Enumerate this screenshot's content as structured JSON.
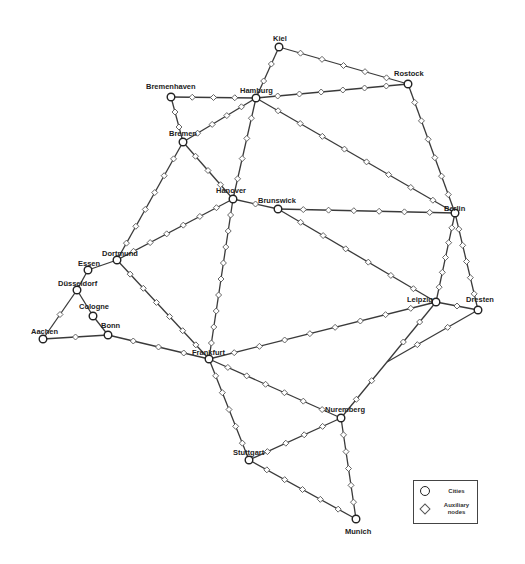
{
  "diagram": {
    "type": "transport-network",
    "edge_color": "#3a3a3a",
    "cities": [
      {
        "id": "kiel",
        "name": "Kiel",
        "x": 279,
        "y": 47,
        "lx": 273,
        "ly": 41
      },
      {
        "id": "rostock",
        "name": "Rostock",
        "x": 408,
        "y": 84,
        "lx": 394,
        "ly": 76
      },
      {
        "id": "bremenhaven",
        "name": "Bremenhaven",
        "x": 171,
        "y": 97,
        "lx": 146,
        "ly": 89
      },
      {
        "id": "hamburg",
        "name": "Hamburg",
        "x": 256,
        "y": 98,
        "lx": 240,
        "ly": 93
      },
      {
        "id": "bremen",
        "name": "Bremen",
        "x": 183,
        "y": 142,
        "lx": 169,
        "ly": 136
      },
      {
        "id": "hanover",
        "name": "Hanover",
        "x": 233,
        "y": 199,
        "lx": 216,
        "ly": 193
      },
      {
        "id": "brunswick",
        "name": "Brunswick",
        "x": 278,
        "y": 209,
        "lx": 258,
        "ly": 203
      },
      {
        "id": "berlin",
        "name": "Berlin",
        "x": 455,
        "y": 213,
        "lx": 444,
        "ly": 211
      },
      {
        "id": "dortmund",
        "name": "Dortmund",
        "x": 117,
        "y": 260,
        "lx": 102,
        "ly": 256
      },
      {
        "id": "essen",
        "name": "Essen",
        "x": 88,
        "y": 270,
        "lx": 78,
        "ly": 266
      },
      {
        "id": "dusseldorf",
        "name": "Düsseldorf",
        "x": 77,
        "y": 290,
        "lx": 58,
        "ly": 286
      },
      {
        "id": "cologne",
        "name": "Cologne",
        "x": 93,
        "y": 316,
        "lx": 79,
        "ly": 309
      },
      {
        "id": "bonn",
        "name": "Bonn",
        "x": 108,
        "y": 335,
        "lx": 101,
        "ly": 328
      },
      {
        "id": "aachen",
        "name": "Aachen",
        "x": 43,
        "y": 339,
        "lx": 31,
        "ly": 334
      },
      {
        "id": "leipzig",
        "name": "Leipzig",
        "x": 436,
        "y": 302,
        "lx": 407,
        "ly": 302
      },
      {
        "id": "dresden",
        "name": "Dresten",
        "x": 478,
        "y": 310,
        "lx": 466,
        "ly": 302
      },
      {
        "id": "frankfurt",
        "name": "Frankfurt",
        "x": 209,
        "y": 359,
        "lx": 192,
        "ly": 355
      },
      {
        "id": "nuremberg",
        "name": "Nuremberg",
        "x": 341,
        "y": 418,
        "lx": 325,
        "ly": 412
      },
      {
        "id": "stuttgart",
        "name": "Stuttgart",
        "x": 249,
        "y": 460,
        "lx": 233,
        "ly": 455
      },
      {
        "id": "munich",
        "name": "Munich",
        "x": 356,
        "y": 519,
        "lx": 345,
        "ly": 534
      }
    ],
    "junctions": [
      {
        "id": "j1",
        "x": 387,
        "y": 362
      }
    ],
    "edges": [
      {
        "from": "kiel",
        "to": "rostock",
        "aux": 5
      },
      {
        "from": "kiel",
        "to": "hamburg",
        "aux": 2
      },
      {
        "from": "bremenhaven",
        "to": "hamburg",
        "aux": 3
      },
      {
        "from": "bremenhaven",
        "to": "bremen",
        "aux": 2
      },
      {
        "from": "hamburg",
        "to": "rostock",
        "aux": 6
      },
      {
        "from": "hamburg",
        "to": "bremen",
        "aux": 4
      },
      {
        "from": "hamburg",
        "to": "hanover",
        "aux": 4
      },
      {
        "from": "hamburg",
        "to": "berlin",
        "aux": 8
      },
      {
        "from": "rostock",
        "to": "berlin",
        "aux": 6
      },
      {
        "from": "bremen",
        "to": "hanover",
        "aux": 3
      },
      {
        "from": "bremen",
        "to": "dortmund",
        "aux": 6
      },
      {
        "from": "hanover",
        "to": "brunswick",
        "aux": 1
      },
      {
        "from": "hanover",
        "to": "dortmund",
        "aux": 6
      },
      {
        "from": "hanover",
        "to": "frankfurt",
        "aux": 9
      },
      {
        "from": "brunswick",
        "to": "berlin",
        "aux": 6
      },
      {
        "from": "brunswick",
        "to": "leipzig",
        "aux": 6
      },
      {
        "from": "berlin",
        "to": "leipzig",
        "aux": 5
      },
      {
        "from": "berlin",
        "to": "dresden",
        "aux": 5
      },
      {
        "from": "leipzig",
        "to": "dresden",
        "aux": 1
      },
      {
        "from": "leipzig",
        "to": "frankfurt",
        "aux": 8
      },
      {
        "from": "leipzig",
        "to": "j1",
        "aux": 2
      },
      {
        "from": "dresden",
        "to": "j1",
        "aux": 2
      },
      {
        "from": "j1",
        "to": "nuremberg",
        "aux": 2
      },
      {
        "from": "dortmund",
        "to": "essen",
        "aux": 0
      },
      {
        "from": "dortmund",
        "to": "frankfurt",
        "aux": 6
      },
      {
        "from": "essen",
        "to": "dusseldorf",
        "aux": 0
      },
      {
        "from": "dusseldorf",
        "to": "cologne",
        "aux": 0
      },
      {
        "from": "dusseldorf",
        "to": "aachen",
        "aux": 1
      },
      {
        "from": "cologne",
        "to": "bonn",
        "aux": 0
      },
      {
        "from": "aachen",
        "to": "bonn",
        "aux": 1
      },
      {
        "from": "bonn",
        "to": "frankfurt",
        "aux": 3
      },
      {
        "from": "frankfurt",
        "to": "nuremberg",
        "aux": 6
      },
      {
        "from": "frankfurt",
        "to": "stuttgart",
        "aux": 5
      },
      {
        "from": "stuttgart",
        "to": "nuremberg",
        "aux": 4
      },
      {
        "from": "stuttgart",
        "to": "munich",
        "aux": 5
      },
      {
        "from": "nuremberg",
        "to": "munich",
        "aux": 5
      }
    ]
  },
  "legend": {
    "cities_label": "Cities",
    "aux_label_line1": "Auxiliary",
    "aux_label_line2": "nodes"
  }
}
